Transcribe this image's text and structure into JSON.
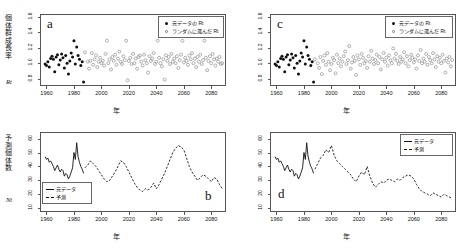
{
  "figure": {
    "axis_x_title": "年",
    "panels": [
      "a",
      "b",
      "c",
      "d"
    ]
  },
  "panel_a": {
    "letter": "a",
    "ylabel_main": "個体群成長率",
    "ylabel_sub": "Rt",
    "xlabel": "年",
    "legend": [
      {
        "marker": "filled-circle",
        "label": "元データの Rt"
      },
      {
        "marker": "open-circle",
        "label": "ランダムに選んだ Rt"
      }
    ]
  },
  "panel_b": {
    "letter": "b",
    "ylabel_main": "予測個体数",
    "ylabel_sub": "Nt",
    "xlabel": "年",
    "legend": [
      {
        "marker": "solid-line",
        "label": "元データ"
      },
      {
        "marker": "dashed-line",
        "label": "予測"
      }
    ]
  },
  "panel_c": {
    "letter": "c",
    "xlabel": "年",
    "legend": [
      {
        "marker": "filled-circle",
        "label": "元データの Rt"
      },
      {
        "marker": "open-circle",
        "label": "ランダムに選んだ Rt"
      }
    ]
  },
  "panel_d": {
    "letter": "d",
    "xlabel": "年",
    "legend": [
      {
        "marker": "solid-line",
        "label": "元データ"
      },
      {
        "marker": "dashed-line",
        "label": "予測"
      }
    ]
  },
  "chart_data": [
    {
      "type": "scatter",
      "panel": "a",
      "title": "",
      "xlabel": "年",
      "ylabel": "個体群成長率 Rt",
      "xlim": [
        1956,
        2090
      ],
      "ylim": [
        0.72,
        1.62
      ],
      "xticks": [
        1960,
        1980,
        2000,
        2020,
        2040,
        2060,
        2080
      ],
      "yticks": [
        0.8,
        1.0,
        1.2,
        1.4,
        1.6
      ],
      "grid": false,
      "legend_position": "top-right",
      "series": [
        {
          "name": "元データの Rt",
          "marker": "filled-circle",
          "color": "#111111",
          "x": [
            1959,
            1960,
            1961,
            1962,
            1963,
            1964,
            1965,
            1966,
            1967,
            1968,
            1969,
            1970,
            1971,
            1972,
            1973,
            1974,
            1975,
            1976,
            1977,
            1978,
            1979,
            1980,
            1981,
            1982,
            1983,
            1984,
            1985,
            1986,
            1987
          ],
          "y": [
            0.99,
            0.97,
            1.02,
            0.95,
            1.06,
            1.09,
            1.05,
            0.89,
            1.08,
            1.11,
            0.98,
            1.04,
            1.12,
            1.07,
            0.94,
            1.1,
            1.0,
            0.86,
            1.03,
            1.13,
            1.08,
            1.29,
            0.99,
            1.21,
            1.1,
            1.05,
            0.97,
            1.02,
            0.76
          ]
        },
        {
          "name": "ランダムに選んだ Rt",
          "marker": "open-circle",
          "color": "#808080",
          "x": [
            1988,
            1990,
            1991,
            1992,
            1993,
            1994,
            1995,
            1996,
            1997,
            1998,
            1999,
            2000,
            2001,
            2002,
            2003,
            2004,
            2005,
            2006,
            2007,
            2008,
            2009,
            2010,
            2011,
            2012,
            2013,
            2014,
            2015,
            2016,
            2017,
            2018,
            2019,
            2020,
            2021,
            2022,
            2023,
            2024,
            2025,
            2026,
            2027,
            2028,
            2029,
            2030,
            2031,
            2032,
            2033,
            2034,
            2035,
            2036,
            2037,
            2038,
            2039,
            2040,
            2041,
            2042,
            2043,
            2044,
            2045,
            2046,
            2047,
            2048,
            2049,
            2050,
            2051,
            2052,
            2053,
            2054,
            2055,
            2056,
            2057,
            2058,
            2059,
            2060,
            2061,
            2062,
            2063,
            2064,
            2065,
            2066,
            2067,
            2068,
            2069,
            2070,
            2071,
            2072,
            2073,
            2074,
            2075,
            2076,
            2077,
            2078,
            2079,
            2080,
            2081,
            2082,
            2083,
            2084,
            2085,
            2086,
            2087,
            2088
          ],
          "y": [
            1.14,
            1.02,
            0.93,
            1.03,
            1.13,
            0.98,
            1.05,
            1.1,
            0.95,
            1.02,
            1.07,
            1.0,
            1.03,
            0.97,
            1.12,
            1.29,
            1.0,
            1.05,
            0.92,
            1.08,
            1.03,
            1.11,
            0.98,
            1.06,
            1.15,
            1.02,
            0.99,
            1.09,
            1.04,
            1.29,
            0.78,
            1.03,
            1.07,
            0.99,
            1.12,
            1.0,
            1.06,
            0.93,
            1.08,
            1.1,
            1.02,
            0.97,
            1.11,
            1.04,
            1.0,
            0.88,
            1.09,
            1.03,
            1.06,
            1.13,
            0.99,
            1.02,
            1.29,
            1.07,
            1.0,
            0.96,
            1.05,
            0.79,
            1.1,
            1.03,
            1.08,
            0.99,
            1.12,
            1.02,
            1.06,
            1.0,
            1.09,
            0.94,
            1.04,
            1.11,
            1.29,
            1.01,
            1.07,
            1.03,
            0.98,
            1.1,
            1.05,
            1.13,
            1.0,
            1.06,
            0.95,
            1.08,
            1.02,
            1.11,
            0.99,
            1.04,
            1.29,
            1.07,
            0.91,
            1.03,
            1.09,
            1.0,
            1.12,
            1.05,
            0.97,
            1.06,
            1.02,
            1.08,
            0.99,
            1.0
          ]
        }
      ]
    },
    {
      "type": "line",
      "panel": "b",
      "title": "",
      "xlabel": "年",
      "ylabel": "予測個体数 Nt",
      "xlim": [
        1956,
        2090
      ],
      "ylim": [
        8,
        64
      ],
      "xticks": [
        1960,
        1980,
        2000,
        2020,
        2040,
        2060,
        2080
      ],
      "yticks": [
        10,
        20,
        30,
        40,
        50,
        60
      ],
      "grid": false,
      "legend_position": "bottom-left",
      "series": [
        {
          "name": "元データ",
          "style": "solid",
          "color": "#111111",
          "x": [
            1959,
            1960,
            1961,
            1962,
            1963,
            1964,
            1965,
            1966,
            1967,
            1968,
            1969,
            1970,
            1971,
            1972,
            1973,
            1974,
            1975,
            1976,
            1977,
            1978,
            1979,
            1980,
            1981,
            1982,
            1983,
            1984,
            1985,
            1986,
            1987
          ],
          "y": [
            47,
            45,
            46,
            43,
            44,
            42,
            40,
            37,
            39,
            41,
            38,
            36,
            38,
            37,
            33,
            35,
            34,
            31,
            33,
            36,
            39,
            50,
            45,
            57,
            47,
            43,
            40,
            38,
            35
          ]
        },
        {
          "name": "予測",
          "style": "dashed",
          "color": "#111111",
          "x": [
            1988,
            1990,
            1992,
            1994,
            1996,
            1998,
            2000,
            2002,
            2004,
            2006,
            2008,
            2010,
            2012,
            2014,
            2016,
            2018,
            2020,
            2022,
            2024,
            2026,
            2028,
            2030,
            2032,
            2034,
            2036,
            2038,
            2040,
            2042,
            2044,
            2046,
            2048,
            2050,
            2052,
            2054,
            2056,
            2058,
            2060,
            2062,
            2064,
            2066,
            2068,
            2070,
            2072,
            2074,
            2076,
            2078,
            2080,
            2082,
            2084,
            2086,
            2088
          ],
          "y": [
            39,
            41,
            44,
            42,
            40,
            37,
            34,
            31,
            29,
            30,
            33,
            36,
            40,
            44,
            43,
            40,
            36,
            32,
            28,
            25,
            23,
            22,
            24,
            23,
            25,
            28,
            24,
            27,
            31,
            35,
            40,
            45,
            50,
            53,
            55,
            54,
            52,
            46,
            40,
            36,
            33,
            30,
            32,
            34,
            33,
            31,
            29,
            32,
            31,
            27,
            24
          ]
        }
      ]
    },
    {
      "type": "scatter",
      "panel": "c",
      "title": "",
      "xlabel": "年",
      "ylabel": "個体群成長率 Rt",
      "xlim": [
        1956,
        2090
      ],
      "ylim": [
        0.72,
        1.62
      ],
      "xticks": [
        1960,
        1980,
        2000,
        2020,
        2040,
        2060,
        2080
      ],
      "yticks": [
        0.8,
        1.0,
        1.2,
        1.4,
        1.6
      ],
      "grid": false,
      "legend_position": "top-right",
      "series": [
        {
          "name": "元データの Rt",
          "marker": "filled-circle",
          "color": "#111111",
          "x": [
            1959,
            1960,
            1961,
            1962,
            1963,
            1964,
            1965,
            1966,
            1967,
            1968,
            1969,
            1970,
            1971,
            1972,
            1973,
            1974,
            1975,
            1976,
            1977,
            1978,
            1979,
            1980,
            1981,
            1982,
            1983,
            1984,
            1985,
            1986,
            1987
          ],
          "y": [
            0.99,
            0.97,
            1.02,
            0.95,
            1.06,
            1.09,
            1.05,
            0.89,
            1.08,
            1.11,
            0.98,
            1.04,
            1.12,
            1.07,
            0.94,
            1.1,
            1.0,
            0.86,
            1.03,
            1.13,
            1.08,
            1.29,
            0.99,
            1.21,
            1.1,
            1.05,
            0.97,
            1.02,
            0.76
          ]
        },
        {
          "name": "ランダムに選んだ Rt",
          "marker": "open-circle",
          "color": "#808080",
          "x": [
            1988,
            1990,
            1991,
            1992,
            1993,
            1994,
            1995,
            1996,
            1997,
            1998,
            1999,
            2000,
            2001,
            2002,
            2003,
            2004,
            2005,
            2006,
            2007,
            2008,
            2009,
            2010,
            2011,
            2012,
            2013,
            2014,
            2015,
            2016,
            2017,
            2018,
            2019,
            2020,
            2021,
            2022,
            2023,
            2024,
            2025,
            2026,
            2027,
            2028,
            2029,
            2030,
            2031,
            2032,
            2033,
            2034,
            2035,
            2036,
            2037,
            2038,
            2039,
            2040,
            2041,
            2042,
            2043,
            2044,
            2045,
            2046,
            2047,
            2048,
            2049,
            2050,
            2051,
            2052,
            2053,
            2054,
            2055,
            2056,
            2057,
            2058,
            2059,
            2060,
            2061,
            2062,
            2063,
            2064,
            2065,
            2066,
            2067,
            2068,
            2069,
            2070,
            2071,
            2072,
            2073,
            2074,
            2075,
            2076,
            2077,
            2078,
            2079,
            2080,
            2081,
            2082,
            2083,
            2084,
            2085,
            2086,
            2087,
            2088
          ],
          "y": [
            1.05,
            1.0,
            0.94,
            1.08,
            0.86,
            1.03,
            1.1,
            0.98,
            1.13,
            1.02,
            0.91,
            0.99,
            1.07,
            1.04,
            0.87,
            1.11,
            1.0,
            1.06,
            0.96,
            1.02,
            1.09,
            1.15,
            0.99,
            1.04,
            1.22,
            0.93,
            1.01,
            1.08,
            1.03,
            0.85,
            1.1,
            1.05,
            0.98,
            1.12,
            1.07,
            1.0,
            1.03,
            0.94,
            1.09,
            1.02,
            1.16,
            1.06,
            0.99,
            1.04,
            1.11,
            1.0,
            1.08,
            0.92,
            1.05,
            1.13,
            1.02,
            1.07,
            0.97,
            1.1,
            1.04,
            1.0,
            1.19,
            1.06,
            1.12,
            1.03,
            0.99,
            1.08,
            1.02,
            1.05,
            1.14,
            1.0,
            1.09,
            0.96,
            1.04,
            1.11,
            1.07,
            1.01,
            1.05,
            0.93,
            1.1,
            1.03,
            1.17,
            1.0,
            1.06,
            1.02,
            1.12,
            0.98,
            1.08,
            1.04,
            1.0,
            1.13,
            1.05,
            0.95,
            1.09,
            1.02,
            1.07,
            1.0,
            1.11,
            1.03,
            0.88,
            1.06,
            1.01,
            1.08,
            0.96,
            1.04
          ]
        }
      ]
    },
    {
      "type": "line",
      "panel": "d",
      "title": "",
      "xlabel": "年",
      "ylabel": "予測個体数 Nt",
      "xlim": [
        1956,
        2090
      ],
      "ylim": [
        8,
        64
      ],
      "xticks": [
        1960,
        1980,
        2000,
        2020,
        2040,
        2060,
        2080
      ],
      "yticks": [
        10,
        20,
        30,
        40,
        50,
        60
      ],
      "grid": false,
      "legend_position": "top-right",
      "series": [
        {
          "name": "元データ",
          "style": "solid",
          "color": "#111111",
          "x": [
            1959,
            1960,
            1961,
            1962,
            1963,
            1964,
            1965,
            1966,
            1967,
            1968,
            1969,
            1970,
            1971,
            1972,
            1973,
            1974,
            1975,
            1976,
            1977,
            1978,
            1979,
            1980,
            1981,
            1982,
            1983,
            1984,
            1985,
            1986,
            1987
          ],
          "y": [
            47,
            45,
            46,
            43,
            44,
            42,
            40,
            37,
            39,
            41,
            38,
            36,
            38,
            37,
            33,
            35,
            34,
            31,
            33,
            36,
            39,
            50,
            45,
            57,
            47,
            43,
            40,
            38,
            35
          ]
        },
        {
          "name": "予測",
          "style": "dashed",
          "color": "#111111",
          "x": [
            1988,
            1990,
            1992,
            1994,
            1996,
            1998,
            2000,
            2002,
            2004,
            2006,
            2008,
            2010,
            2012,
            2014,
            2016,
            2018,
            2020,
            2022,
            2024,
            2026,
            2028,
            2030,
            2032,
            2034,
            2036,
            2038,
            2040,
            2042,
            2044,
            2046,
            2048,
            2050,
            2052,
            2054,
            2056,
            2058,
            2060,
            2062,
            2064,
            2066,
            2068,
            2070,
            2072,
            2074,
            2076,
            2078,
            2080,
            2082,
            2084,
            2086,
            2088
          ],
          "y": [
            38,
            42,
            46,
            48,
            52,
            50,
            55,
            48,
            44,
            42,
            40,
            38,
            36,
            34,
            31,
            29,
            33,
            36,
            34,
            40,
            33,
            28,
            25,
            27,
            29,
            28,
            30,
            31,
            30,
            29,
            31,
            30,
            32,
            33,
            34,
            33,
            31,
            27,
            24,
            22,
            21,
            20,
            19,
            21,
            20,
            19,
            18,
            20,
            19,
            18,
            17
          ]
        }
      ]
    }
  ]
}
